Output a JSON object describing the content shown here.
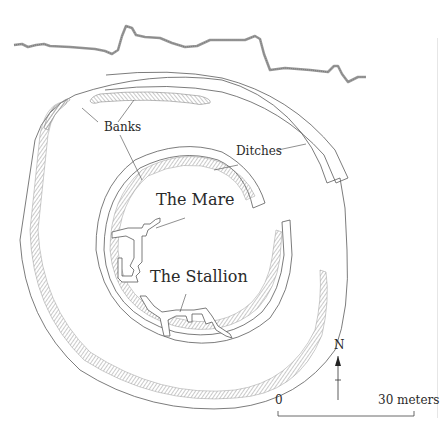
{
  "diagram": {
    "type": "archaeological-site-plan",
    "labels": {
      "banks": "Banks",
      "ditches": "Ditches",
      "mare": "The Mare",
      "stallion": "The Stallion"
    },
    "compass": {
      "north": "N"
    },
    "scale_bar": {
      "start": "0",
      "end": "30 meters"
    },
    "colors": {
      "line": "#5a5a5a",
      "hatch": "#8a8a8a",
      "profile": "#9a9a9a",
      "text": "#2a2a2a"
    }
  }
}
